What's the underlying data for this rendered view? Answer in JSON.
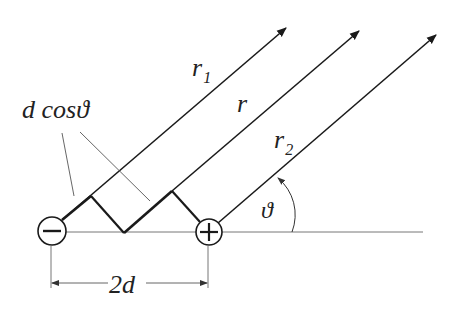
{
  "labels": {
    "r1": "r",
    "r1_sub": "1",
    "r": "r",
    "r2": "r",
    "r2_sub": "2",
    "dcos": "d cosϑ",
    "theta": "ϑ",
    "separation": "2d"
  },
  "charges": {
    "negative": "−",
    "positive": "+"
  },
  "colors": {
    "line": "#1a1a1a",
    "thin": "#555555",
    "background": "#ffffff"
  }
}
